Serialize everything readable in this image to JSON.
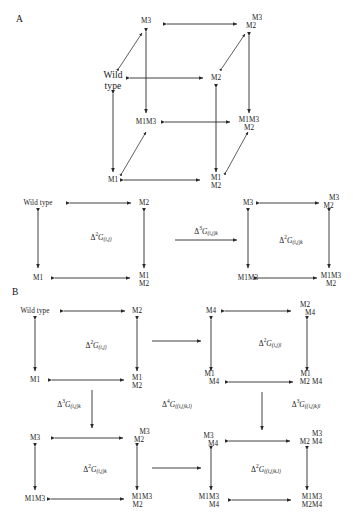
{
  "figure": {
    "panels": [
      {
        "id": "A",
        "letter": "A"
      },
      {
        "id": "B",
        "letter": "B"
      }
    ]
  },
  "panel_a": {
    "letter": "A",
    "cube": {
      "description": "Three-dimensional thermodynamic mutant cube relating wild type and single, double and triple mutants",
      "nodes": [
        {
          "id": "cube-back-top-left",
          "label": "M3",
          "lines": [
            "M3"
          ]
        },
        {
          "id": "cube-back-top-right",
          "label": "M3 M2",
          "lines": [
            "M3",
            "M2"
          ]
        },
        {
          "id": "cube-front-top-left",
          "label": "Wild type",
          "lines": [
            "Wild",
            "type"
          ]
        },
        {
          "id": "cube-front-top-right",
          "label": "M2",
          "lines": [
            "M2"
          ]
        },
        {
          "id": "cube-back-bottom-left",
          "label": "M1M3",
          "lines": [
            "M1M3"
          ]
        },
        {
          "id": "cube-back-bottom-right",
          "label": "M1M3 M2",
          "lines": [
            "M1M3",
            "M2"
          ]
        },
        {
          "id": "cube-front-bottom-left",
          "label": "M1",
          "lines": [
            "M1"
          ]
        },
        {
          "id": "cube-front-bottom-right",
          "label": "M1 M2",
          "lines": [
            "M1",
            "M2"
          ]
        }
      ]
    },
    "square_left": {
      "nodes": [
        {
          "id": "a-sq1-tl",
          "label": "Wild type",
          "lines": [
            "Wild type"
          ]
        },
        {
          "id": "a-sq1-tr",
          "label": "M2",
          "lines": [
            "M2"
          ]
        },
        {
          "id": "a-sq1-bl",
          "label": "M1",
          "lines": [
            "M1"
          ]
        },
        {
          "id": "a-sq1-br",
          "label": "M1 M2",
          "lines": [
            "M1",
            "M2"
          ]
        }
      ],
      "energy": {
        "delta": "2",
        "symbol": "G",
        "subscript": "(i,j)"
      }
    },
    "square_right": {
      "nodes": [
        {
          "id": "a-sq2-tl",
          "label": "M3",
          "lines": [
            "M3"
          ]
        },
        {
          "id": "a-sq2-tr",
          "label": "M3 M2",
          "lines": [
            "M3",
            "M2"
          ]
        },
        {
          "id": "a-sq2-bl",
          "label": "M1M3",
          "lines": [
            "M1M3"
          ]
        },
        {
          "id": "a-sq2-br",
          "label": "M1M3 M2",
          "lines": [
            "M1M3",
            "M2"
          ]
        }
      ],
      "energy": {
        "delta": "2",
        "symbol": "G",
        "subscript": "(i,j)k"
      }
    },
    "link_energy": {
      "delta": "3",
      "symbol": "G",
      "subscript": "(i,j)k"
    }
  },
  "panel_b": {
    "letter": "B",
    "square_tl": {
      "nodes": [
        {
          "id": "b-tl-tl",
          "label": "Wild type",
          "lines": [
            "Wild type"
          ]
        },
        {
          "id": "b-tl-tr",
          "label": "M2",
          "lines": [
            "M2"
          ]
        },
        {
          "id": "b-tl-bl",
          "label": "M1",
          "lines": [
            "M1"
          ]
        },
        {
          "id": "b-tl-br",
          "label": "M1 M2",
          "lines": [
            "M1",
            "M2"
          ]
        }
      ],
      "energy": {
        "delta": "2",
        "symbol": "G",
        "subscript": "(i,j)"
      }
    },
    "square_tr": {
      "nodes": [
        {
          "id": "b-tr-tl",
          "label": "M4",
          "lines": [
            "M4"
          ]
        },
        {
          "id": "b-tr-tr",
          "label": "M2 M4",
          "lines": [
            "M2",
            "M4"
          ]
        },
        {
          "id": "b-tr-bl",
          "label": "M1 M4",
          "lines": [
            "M1",
            "M4"
          ]
        },
        {
          "id": "b-tr-br",
          "label": "M1 M2 M4",
          "lines": [
            "M1",
            "M2 M4"
          ]
        }
      ],
      "energy": {
        "delta": "2",
        "symbol": "G",
        "subscript": "(i,j)l"
      }
    },
    "square_bl": {
      "nodes": [
        {
          "id": "b-bl-tl",
          "label": "M3",
          "lines": [
            "M3"
          ]
        },
        {
          "id": "b-bl-tr",
          "label": "M3 M2",
          "lines": [
            "M3",
            "M2"
          ]
        },
        {
          "id": "b-bl-bl",
          "label": "M1M3",
          "lines": [
            "M1M3"
          ]
        },
        {
          "id": "b-bl-br",
          "label": "M1M3 M2",
          "lines": [
            "M1M3",
            "M2"
          ]
        }
      ],
      "energy": {
        "delta": "2",
        "symbol": "G",
        "subscript": "(i,j)k"
      }
    },
    "square_br": {
      "nodes": [
        {
          "id": "b-br-tl",
          "label": "M3 M4",
          "lines": [
            "M3",
            "M4"
          ]
        },
        {
          "id": "b-br-tr",
          "label": "M3 M2 M4",
          "lines": [
            "M3",
            "M2 M4"
          ]
        },
        {
          "id": "b-br-bl",
          "label": "M1M3 M4",
          "lines": [
            "M1M3",
            "M4"
          ]
        },
        {
          "id": "b-br-br",
          "label": "M1M3 M2M4",
          "lines": [
            "M1M3",
            "M2M4"
          ]
        }
      ],
      "energy": {
        "delta": "2",
        "symbol": "G",
        "subscript": "((i,j)k,l)"
      }
    },
    "energy_left": {
      "delta": "3",
      "symbol": "G",
      "subscript": "(i,j)k"
    },
    "energy_center": {
      "delta": "4",
      "symbol": "G",
      "subscript": "((i,j)k,l)"
    },
    "energy_right": {
      "delta": "3",
      "symbol": "G",
      "subscript": "((i,j)k)l"
    }
  }
}
